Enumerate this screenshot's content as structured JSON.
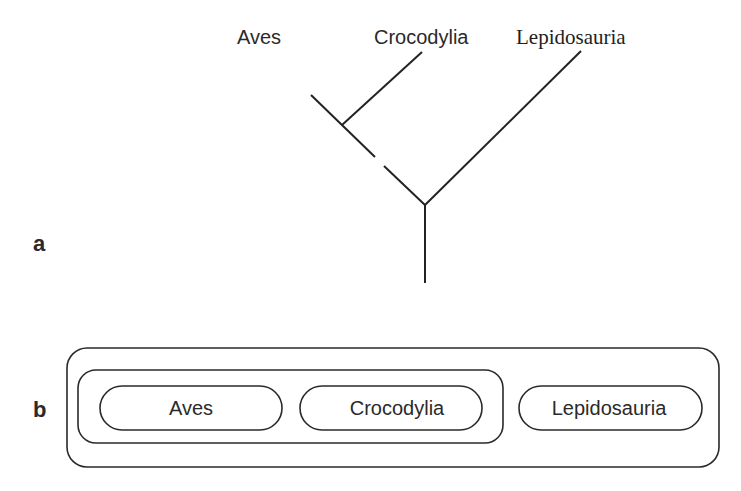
{
  "panels": {
    "a": {
      "letter": "a"
    },
    "b": {
      "letter": "b"
    }
  },
  "cladogram": {
    "taxa": [
      "Aves",
      "Crocodylia",
      "Lepidosauria"
    ],
    "labels": {
      "aves": "Aves",
      "crocodylia": "Crocodylia",
      "lepidosauria": "Lepidosauria"
    },
    "topology": "((Aves, Crocodylia), Lepidosauria)"
  },
  "nested_sets": {
    "outer_group": [
      "Aves",
      "Crocodylia",
      "Lepidosauria"
    ],
    "inner_group": [
      "Aves",
      "Crocodylia"
    ],
    "labels": {
      "aves": "Aves",
      "crocodylia": "Crocodylia",
      "lepidosauria": "Lepidosauria"
    }
  },
  "colors": {
    "line": "#222222",
    "background": "#ffffff"
  }
}
